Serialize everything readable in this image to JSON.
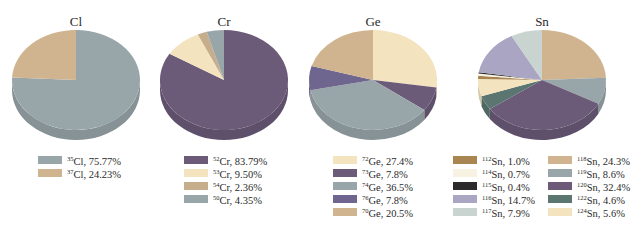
{
  "chart_data": [
    {
      "type": "pie",
      "title": "Cl",
      "labels": [
        "35Cl",
        "37Cl"
      ],
      "values": [
        75.77,
        24.23
      ],
      "legend": [
        {
          "mass": "35",
          "el": "Cl",
          "value": "75.77%",
          "color": "#98a6a9"
        },
        {
          "mass": "37",
          "el": "Cl",
          "value": "24.23%",
          "color": "#cfb48f"
        }
      ],
      "slice_order": [
        0,
        1
      ]
    },
    {
      "type": "pie",
      "title": "Cr",
      "labels": [
        "52Cr",
        "53Cr",
        "54Cr",
        "50Cr"
      ],
      "values": [
        83.79,
        9.5,
        2.36,
        4.35
      ],
      "legend": [
        {
          "mass": "52",
          "el": "Cr",
          "value": "83.79%",
          "color": "#6b5a78"
        },
        {
          "mass": "53",
          "el": "Cr",
          "value": "9.50%",
          "color": "#f3e4bf"
        },
        {
          "mass": "54",
          "el": "Cr",
          "value": "2.36%",
          "color": "#c6ae8c"
        },
        {
          "mass": "50",
          "el": "Cr",
          "value": "4.35%",
          "color": "#98a6a9"
        }
      ],
      "slice_order": [
        0,
        1,
        2,
        3
      ]
    },
    {
      "type": "pie",
      "title": "Ge",
      "labels": [
        "72Ge",
        "73Ge",
        "74Ge",
        "76Ge",
        "70Ge"
      ],
      "values": [
        27.4,
        7.8,
        36.5,
        7.8,
        20.5
      ],
      "legend": [
        {
          "mass": "72",
          "el": "Ge",
          "value": "27.4%",
          "color": "#f3e4bf"
        },
        {
          "mass": "73",
          "el": "Ge",
          "value": "7.8%",
          "color": "#6b5a78"
        },
        {
          "mass": "74",
          "el": "Ge",
          "value": "36.5%",
          "color": "#98a6a9"
        },
        {
          "mass": "76",
          "el": "Ge",
          "value": "7.8%",
          "color": "#6f6690"
        },
        {
          "mass": "70",
          "el": "Ge",
          "value": "20.5%",
          "color": "#cfb48f"
        }
      ],
      "slice_order": [
        0,
        1,
        2,
        3,
        4
      ]
    },
    {
      "type": "pie",
      "title": "Sn",
      "labels": [
        "112Sn",
        "114Sn",
        "115Sn",
        "116Sn",
        "117Sn",
        "118Sn",
        "119Sn",
        "120Sn",
        "122Sn",
        "124Sn"
      ],
      "values": [
        1.0,
        0.7,
        0.4,
        14.7,
        7.9,
        24.3,
        8.6,
        32.4,
        4.6,
        5.6
      ],
      "legend": [
        {
          "mass": "112",
          "el": "Sn",
          "value": "1.0%",
          "color": "#a98552"
        },
        {
          "mass": "114",
          "el": "Sn",
          "value": "0.7%",
          "color": "#f8f2e2"
        },
        {
          "mass": "115",
          "el": "Sn",
          "value": "0.4%",
          "color": "#2d2a2c"
        },
        {
          "mass": "116",
          "el": "Sn",
          "value": "14.7%",
          "color": "#aaa5c2"
        },
        {
          "mass": "117",
          "el": "Sn",
          "value": "7.9%",
          "color": "#c9d4d0"
        },
        {
          "mass": "118",
          "el": "Sn",
          "value": "24.3%",
          "color": "#cfb48f"
        },
        {
          "mass": "119",
          "el": "Sn",
          "value": "8.6%",
          "color": "#98a6a9"
        },
        {
          "mass": "120",
          "el": "Sn",
          "value": "32.4%",
          "color": "#6b5a78"
        },
        {
          "mass": "122",
          "el": "Sn",
          "value": "4.6%",
          "color": "#5b7670"
        },
        {
          "mass": "124",
          "el": "Sn",
          "value": "5.6%",
          "color": "#f3e4bf"
        }
      ],
      "slice_order": [
        5,
        6,
        7,
        8,
        9,
        0,
        1,
        2,
        3,
        4
      ]
    }
  ]
}
